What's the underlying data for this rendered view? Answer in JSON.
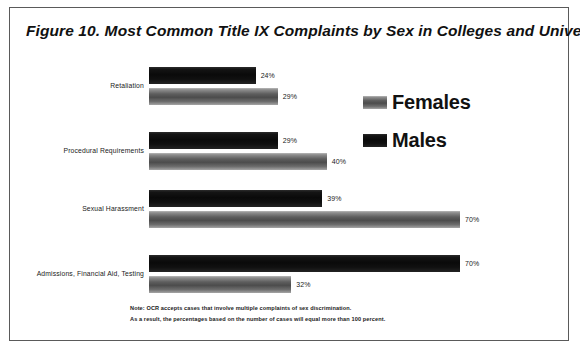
{
  "figure": {
    "title": "Figure 10. Most Common Title IX Complaints by Sex in Colleges and Universities"
  },
  "legend": {
    "items": [
      {
        "label": "Females",
        "color": "#5e5e5e",
        "swatch_name": "legend-swatch-females"
      },
      {
        "label": "Males",
        "color": "#0a0a0a",
        "swatch_name": "legend-swatch-males"
      }
    ]
  },
  "footnote": {
    "lines": [
      "Note: OCR accepts cases that involve multiple complaints of sex discrimination.",
      "As a result, the percentages based on the number of cases will equal more than 100 percent."
    ]
  },
  "chart_data": {
    "type": "bar",
    "orientation": "horizontal",
    "title": "Figure 10. Most Common Title IX Complaints by Sex in Colleges and Universities",
    "xlabel": "",
    "ylabel": "",
    "xlim": [
      0,
      70
    ],
    "grid": false,
    "legend_position": "right",
    "categories": [
      "Retaliation",
      "Procedural Requirements",
      "Sexual Harassment",
      "Admissions, Financial Aid, Testing"
    ],
    "series": [
      {
        "name": "Males",
        "color": "#0a0a0a",
        "values": [
          24,
          29,
          39,
          70
        ],
        "labels": [
          "24%",
          "29%",
          "39%",
          "70%"
        ]
      },
      {
        "name": "Females",
        "color": "#5e5e5e",
        "values": [
          29,
          40,
          70,
          32
        ],
        "labels": [
          "29%",
          "40%",
          "70%",
          "32%"
        ]
      }
    ],
    "note": "Note: OCR accepts cases that involve multiple complaints of sex discrimination. As a result, the percentages based on the number of cases will equal more than 100 percent."
  }
}
